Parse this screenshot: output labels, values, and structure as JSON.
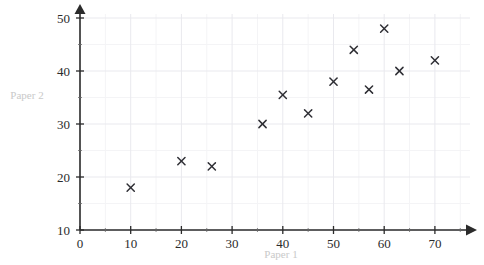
{
  "chart_data": {
    "type": "scatter",
    "title": "",
    "xlabel": "Paper 1",
    "ylabel": "Paper 2",
    "xlim": [
      0,
      75
    ],
    "ylim": [
      10,
      52
    ],
    "xticks": [
      0,
      10,
      20,
      30,
      40,
      50,
      60,
      70
    ],
    "yticks": [
      10,
      20,
      30,
      40,
      50
    ],
    "xtick_labels": [
      "0",
      "10",
      "20",
      "30",
      "40",
      "50",
      "60",
      "70"
    ],
    "ytick_labels": [
      "10",
      "20",
      "30",
      "40",
      "50"
    ],
    "grid": true,
    "grid_minor_step_x": 5,
    "grid_minor_step_y": 5,
    "legend": null,
    "marker": "x",
    "marker_color": "#2f2f35",
    "points": [
      {
        "x": 10,
        "y": 18
      },
      {
        "x": 20,
        "y": 23
      },
      {
        "x": 26,
        "y": 22
      },
      {
        "x": 36,
        "y": 30
      },
      {
        "x": 40,
        "y": 35.5
      },
      {
        "x": 45,
        "y": 32
      },
      {
        "x": 50,
        "y": 38
      },
      {
        "x": 54,
        "y": 44
      },
      {
        "x": 57,
        "y": 36.5
      },
      {
        "x": 60,
        "y": 48
      },
      {
        "x": 63,
        "y": 40
      },
      {
        "x": 70,
        "y": 42
      }
    ]
  },
  "axes": {
    "x_axis_label": "Paper 1",
    "y_axis_label": "Paper 2"
  },
  "colors": {
    "background": "#ffffff",
    "axis": "#2b2b2b",
    "grid_major": "#e9e9ee",
    "grid_minor": "#f4f4f6",
    "marker": "#2f2f35",
    "axis_title": "#c9c9c9"
  }
}
